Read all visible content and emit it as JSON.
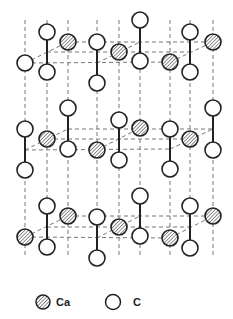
{
  "diagram": {
    "title": "",
    "colors": {
      "stroke": "#222222",
      "dash": "#777777",
      "ca_hatch": "#555555",
      "c_fill": "#ffffff"
    },
    "layers": [
      {
        "name": "top",
        "box": {
          "fl": [
            25,
            63
          ],
          "bl": [
            68,
            42
          ],
          "br": [
            213,
            42
          ],
          "fr": [
            170,
            62
          ]
        },
        "inner_h": {
          "y": 52,
          "x1": 47,
          "x2": 190
        },
        "inner_diag": [
          [
            97,
            63
          ],
          [
            140,
            42
          ]
        ],
        "ca": [
          [
            68,
            42
          ],
          [
            119,
            52
          ],
          [
            170,
            62
          ],
          [
            213,
            42
          ]
        ],
        "c_pairs": [
          [
            [
              47,
              32
            ],
            [
              47,
              72
            ]
          ],
          [
            [
              97,
              42
            ],
            [
              97,
              83
            ]
          ],
          [
            [
              140,
              20
            ],
            [
              140,
              61
            ]
          ],
          [
            [
              190,
              32
            ],
            [
              190,
              72
            ]
          ]
        ],
        "c_single": [
          [
            25,
            63
          ]
        ]
      },
      {
        "name": "middle",
        "box": {
          "fl": [
            25,
            150
          ],
          "bl": [
            68,
            129
          ],
          "br": [
            213,
            129
          ],
          "fr": [
            170,
            149
          ]
        },
        "inner_h": {
          "y": 139,
          "x1": 47,
          "x2": 190
        },
        "inner_diag": [
          [
            97,
            150
          ],
          [
            140,
            128
          ]
        ],
        "ca": [
          [
            47,
            139
          ],
          [
            97,
            150
          ],
          [
            140,
            128
          ],
          [
            190,
            139
          ]
        ],
        "c_pairs": [
          [
            [
              25,
              129
            ],
            [
              25,
              170
            ]
          ],
          [
            [
              68,
              108
            ],
            [
              68,
              149
            ]
          ],
          [
            [
              119,
              120
            ],
            [
              119,
              160
            ]
          ],
          [
            [
              170,
              129
            ],
            [
              170,
              169
            ]
          ],
          [
            [
              213,
              108
            ],
            [
              213,
              150
            ]
          ]
        ],
        "c_single": []
      },
      {
        "name": "bottom",
        "box": {
          "fl": [
            25,
            237
          ],
          "bl": [
            68,
            216
          ],
          "br": [
            213,
            216
          ],
          "fr": [
            170,
            238
          ]
        },
        "inner_h": {
          "y": 227,
          "x1": 47,
          "x2": 190
        },
        "inner_diag": [
          [
            97,
            238
          ],
          [
            140,
            216
          ]
        ],
        "ca": [
          [
            25,
            237
          ],
          [
            68,
            216
          ],
          [
            119,
            227
          ],
          [
            170,
            238
          ],
          [
            213,
            216
          ]
        ],
        "c_pairs": [
          [
            [
              47,
              206
            ],
            [
              47,
              247
            ]
          ],
          [
            [
              97,
              217
            ],
            [
              97,
              258
            ]
          ],
          [
            [
              140,
              196
            ],
            [
              140,
              236
            ]
          ],
          [
            [
              190,
              206
            ],
            [
              190,
              248
            ]
          ]
        ],
        "c_single": []
      }
    ],
    "verticals": [
      25,
      47,
      68,
      97,
      119,
      140,
      170,
      190,
      213
    ],
    "vertical_range": [
      42,
      238
    ]
  },
  "legend": {
    "items": [
      {
        "symbol": "ca-atom",
        "label": "Ca",
        "x": 43,
        "y": 302
      },
      {
        "symbol": "c-atom",
        "label": "C",
        "x": 113,
        "y": 302
      }
    ]
  }
}
